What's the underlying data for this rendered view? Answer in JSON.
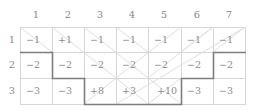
{
  "grid": {
    "column_headers": [
      "1",
      "2",
      "3",
      "4",
      "5",
      "6",
      "7"
    ],
    "row_headers": [
      "1",
      "2",
      "3"
    ],
    "rows": [
      [
        "−1",
        "+1",
        "−1",
        "−1",
        "−1",
        "−1",
        "−1"
      ],
      [
        "−2",
        "−2",
        "−2",
        "−2",
        "−2",
        "−2",
        "−2"
      ],
      [
        "−3",
        "−3",
        "+8",
        "+3",
        "+10",
        "−3",
        "−3"
      ]
    ]
  },
  "colors": {
    "grid_line": "#d4d4d4",
    "boundary_line": "#7a7a7a",
    "diagonal_line": "#dcdcdc",
    "text": "#8a8a8a"
  }
}
